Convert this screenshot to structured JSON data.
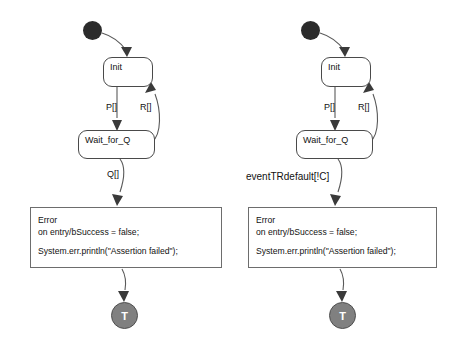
{
  "diagram": {
    "type": "uml-state-machine",
    "background_color": "#ffffff",
    "stroke_color": "#5a5a5a",
    "initial_node_color": "#2b2b2b",
    "terminal_node_color": "#808080",
    "machines": [
      {
        "id": "left",
        "initial_pseudostate": "initial-node",
        "states": [
          {
            "name": "Init"
          },
          {
            "name": "Wait_for_Q"
          }
        ],
        "error_state": {
          "name": "Error",
          "entry_action": "on entry/bSuccess = false;",
          "body": "System.err.println(\"Assertion failed\");"
        },
        "terminal_label": "T",
        "transitions": [
          {
            "from": "initial",
            "to": "Init",
            "label": ""
          },
          {
            "from": "Init",
            "to": "Wait_for_Q",
            "label": "P[]"
          },
          {
            "from": "Wait_for_Q",
            "to": "Init",
            "label": "R[]"
          },
          {
            "from": "Wait_for_Q",
            "to": "Error",
            "label": "Q[]"
          },
          {
            "from": "Error",
            "to": "terminal",
            "label": ""
          }
        ]
      },
      {
        "id": "right",
        "initial_pseudostate": "initial-node",
        "states": [
          {
            "name": "Init"
          },
          {
            "name": "Wait_for_Q"
          }
        ],
        "error_state": {
          "name": "Error",
          "entry_action": "on entry/bSuccess = false;",
          "body": "System.err.println(\"Assertion failed\");"
        },
        "terminal_label": "T",
        "transitions": [
          {
            "from": "initial",
            "to": "Init",
            "label": ""
          },
          {
            "from": "Init",
            "to": "Wait_for_Q",
            "label": "P[]"
          },
          {
            "from": "Wait_for_Q",
            "to": "Init",
            "label": "R[]"
          },
          {
            "from": "Wait_for_Q",
            "to": "Error",
            "label": "eventTRdefault[!C]"
          },
          {
            "from": "Error",
            "to": "terminal",
            "label": ""
          }
        ]
      }
    ]
  }
}
